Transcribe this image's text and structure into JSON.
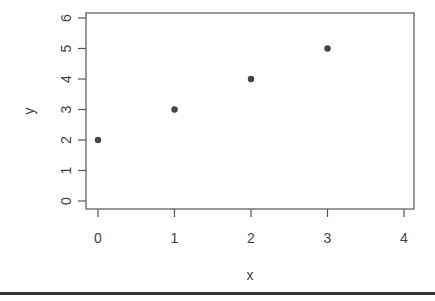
{
  "chart_data": {
    "type": "scatter",
    "title": "",
    "xlabel": "x",
    "ylabel": "y",
    "x": [
      0,
      1,
      2,
      3
    ],
    "y": [
      2,
      3,
      4,
      5
    ],
    "series": [
      {
        "name": "points",
        "x": [
          0,
          1,
          2,
          3
        ],
        "y": [
          2,
          3,
          4,
          5
        ],
        "marker": "filled-circle",
        "color": "#444444"
      }
    ],
    "xlim": [
      0,
      4
    ],
    "ylim": [
      0,
      6
    ],
    "xticks": [
      0,
      1,
      2,
      3,
      4
    ],
    "yticks": [
      0,
      1,
      2,
      3,
      4,
      5,
      6
    ],
    "xtick_labels": [
      "0",
      "1",
      "2",
      "3",
      "4"
    ],
    "ytick_labels": [
      "0",
      "1",
      "2",
      "3",
      "4",
      "5",
      "6"
    ],
    "grid": false,
    "legend": null
  },
  "colors": {
    "axis": "#555555",
    "text": "#444444",
    "point": "#444444",
    "rule": "#333333"
  }
}
